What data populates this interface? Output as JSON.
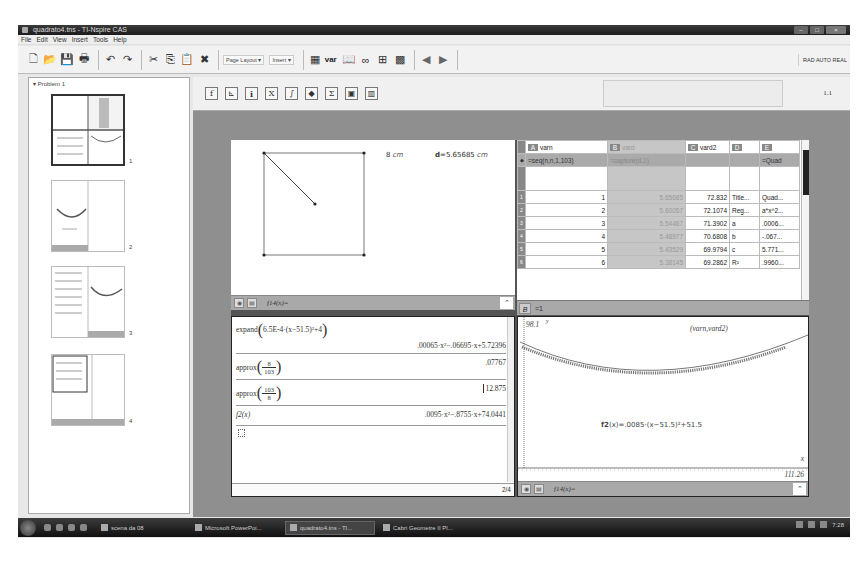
{
  "window": {
    "title": "quadrato4.tns - TI-Nspire CAS",
    "controls": [
      "minimize",
      "maximize",
      "close"
    ]
  },
  "menu": [
    "File",
    "Edit",
    "View",
    "Insert",
    "Tools",
    "Help"
  ],
  "toolbar": {
    "page_layout_label": "Page Layout",
    "insert_label": "Insert",
    "var_label": "var",
    "mode_status": "RAD AUTO REAL"
  },
  "sorter": {
    "problem_label": "Problem 1",
    "pages": [
      {
        "number": "1",
        "active": true
      },
      {
        "number": "2",
        "active": false
      },
      {
        "number": "3",
        "active": false
      },
      {
        "number": "4",
        "active": false
      }
    ]
  },
  "doc_toolbar": {
    "buttons": [
      "f-x",
      "graph",
      "info",
      "x-squared",
      "d-integral",
      "palette",
      "sigma",
      "catalog",
      "templates"
    ],
    "page_number": "1.1"
  },
  "geometry": {
    "side_label_value": "8",
    "side_label_unit": "cm",
    "distance_label": "d",
    "distance_value": "=5.65685",
    "distance_unit": "cm",
    "entry_line": "f14(x)="
  },
  "spreadsheet": {
    "columns": [
      {
        "letter": "A",
        "name": "varn",
        "formula": "=seq(n,n,1,103)",
        "shaded": false
      },
      {
        "letter": "B",
        "name": "vard",
        "formula": "=capture(d,1)",
        "shaded": true
      },
      {
        "letter": "C",
        "name": "vard2",
        "formula": "",
        "shaded": false
      },
      {
        "letter": "D",
        "name": "",
        "formula": "",
        "shaded": false
      },
      {
        "letter": "E",
        "name": "",
        "formula": "=Quad",
        "shaded": false
      }
    ],
    "rows": [
      {
        "n": "1",
        "A": "1",
        "B": "5.65685",
        "C": "72.832",
        "D": "Title...",
        "E": "Quad..."
      },
      {
        "n": "2",
        "A": "2",
        "B": "5.60057",
        "C": "72.1074",
        "D": "Reg...",
        "E": "a*x^2..."
      },
      {
        "n": "3",
        "A": "3",
        "B": "5.54467",
        "C": "71.3902",
        "D": "a",
        "E": ".0006..."
      },
      {
        "n": "4",
        "A": "4",
        "B": "5.48977",
        "C": "70.6808",
        "D": "b",
        "E": "-.067..."
      },
      {
        "n": "5",
        "A": "5",
        "B": "5.43529",
        "C": "69.9794",
        "D": "c",
        "E": "5.771..."
      },
      {
        "n": "6",
        "A": "6",
        "B": "5.38145",
        "C": "69.2862",
        "D": "R²",
        "E": ".9960..."
      }
    ],
    "formula_bar": {
      "cell": "B",
      "value": "=1"
    }
  },
  "calculator": {
    "entries": [
      {
        "input_fn": "expand",
        "input_arg": "6.5E-4·(x−51.5)²+4",
        "output": ".00065·x²−.06695·x+5.72396"
      },
      {
        "input_fn": "approx",
        "num": "8",
        "den": "103",
        "output": ".07767"
      },
      {
        "input_fn": "approx",
        "num": "103",
        "den": "8",
        "output": "12.875"
      },
      {
        "input_fn": "f2(x)",
        "output": ".0095·x²−.8755·x+74.0441"
      }
    ],
    "status": "2/4"
  },
  "graph": {
    "y_max_label": "98.1",
    "y_axis_label": "y",
    "x_axis_label": "x",
    "x_max_label": "111.26",
    "scatter_label": "(varn,vard2)",
    "function_label_name": "f2",
    "function_label_expr": "(x)=.0085·(x−51.5)²+51.5",
    "entry_line": "f14(x)="
  },
  "taskbar": {
    "items": [
      {
        "label": "scena da 08",
        "active": false
      },
      {
        "label": "Microsoft PowerPoi...",
        "active": false
      },
      {
        "label": "quadrato4.tns - TI...",
        "active": true
      },
      {
        "label": "Cabri Geometre II Pl...",
        "active": false
      }
    ],
    "clock": "7:28"
  }
}
